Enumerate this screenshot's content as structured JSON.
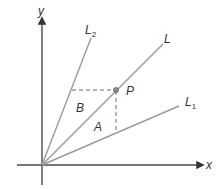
{
  "diagram": {
    "axes": {
      "x_label": "x",
      "y_label": "y"
    },
    "lines": [
      {
        "name": "L",
        "label": "L",
        "subscript": ""
      },
      {
        "name": "L1",
        "label": "L",
        "subscript": "1"
      },
      {
        "name": "L2",
        "label": "L",
        "subscript": "2"
      }
    ],
    "point": {
      "label": "P"
    },
    "regions": [
      {
        "label": "A"
      },
      {
        "label": "B"
      }
    ],
    "colors": {
      "axis": "#4a4a4a",
      "ray": "#9a9a9a",
      "dash": "#6a6a6a",
      "text": "#333333"
    }
  }
}
